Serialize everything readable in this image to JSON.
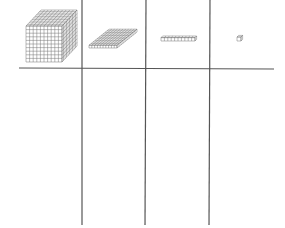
{
  "diagram": {
    "type": "place-value-chart",
    "columns": [
      {
        "place": "thousands",
        "block": "cube"
      },
      {
        "place": "hundreds",
        "block": "flat"
      },
      {
        "place": "tens",
        "block": "rod"
      },
      {
        "place": "ones",
        "block": "unit"
      }
    ],
    "colors": {
      "line": "#555555",
      "grid": "#777777",
      "background": "#ffffff"
    }
  }
}
